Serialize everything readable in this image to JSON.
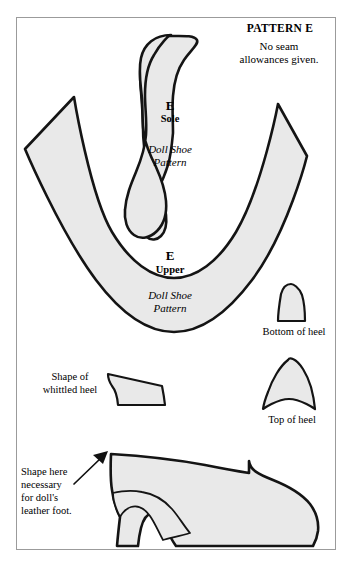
{
  "sheet": {
    "background_color": "#ffffff",
    "border_color": "#9b9b9b",
    "shape_fill": "#e9e9e9",
    "shape_stroke": "#141414"
  },
  "header": {
    "title": "PATTERN E",
    "note": "No seam\nallowances given."
  },
  "pieces": {
    "sole": {
      "letter": "E",
      "name": "Sole",
      "subtitle": "Doll Shoe\nPattern"
    },
    "upper": {
      "letter": "E",
      "name": "Upper",
      "subtitle": "Doll Shoe\nPattern"
    },
    "bottom_of_heel": {
      "label": "Bottom of heel"
    },
    "top_of_heel": {
      "label": "Top of heel"
    },
    "whittled_heel": {
      "label": "Shape of\nwhittled heel"
    },
    "shoe_profile": {
      "annotation": "Shape here\nnecessary\nfor doll's\nleather foot."
    }
  }
}
